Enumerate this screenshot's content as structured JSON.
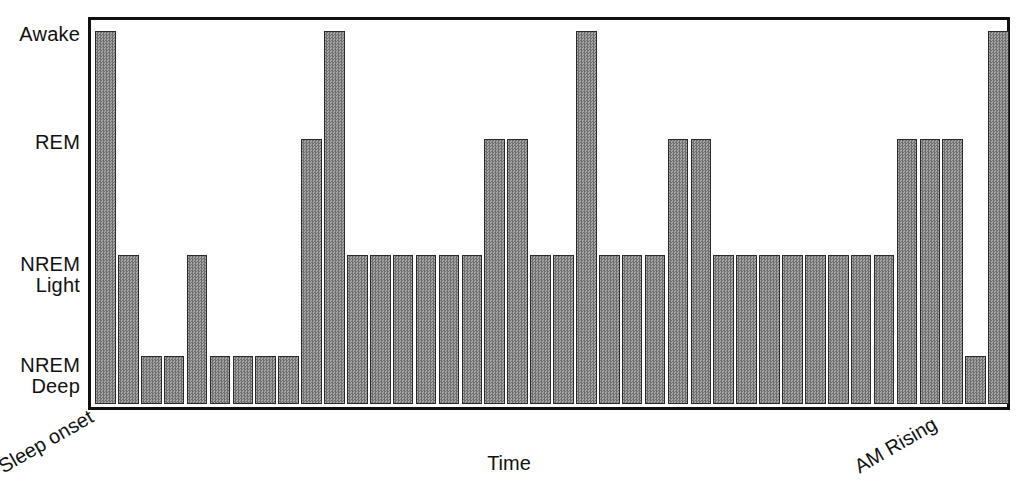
{
  "chart_data": {
    "type": "bar",
    "title": "",
    "subtitle": "",
    "xlabel": "Time",
    "ylabel": "",
    "grid": false,
    "legend": null,
    "y_categories": [
      "NREM Deep",
      "NREM Light",
      "REM",
      "Awake"
    ],
    "ytick_labels": [
      {
        "id": "awake",
        "line1": "Awake",
        "line2": "",
        "value": 4
      },
      {
        "id": "rem",
        "line1": "REM",
        "line2": "",
        "value": 3
      },
      {
        "id": "nrem-light",
        "line1": "NREM",
        "line2": "Light",
        "value": 2
      },
      {
        "id": "nrem-deep",
        "line1": "NREM",
        "line2": "Deep",
        "value": 1
      }
    ],
    "x_endpoint_labels": {
      "start": "Sleep onset",
      "end": "AM Rising"
    },
    "ylim": [
      0,
      4
    ],
    "categories": [
      "1",
      "2",
      "3",
      "4",
      "5",
      "6",
      "7",
      "8",
      "9",
      "10",
      "11",
      "12",
      "13",
      "14",
      "15",
      "16",
      "17",
      "18",
      "19",
      "20",
      "21",
      "22",
      "23",
      "24",
      "25",
      "26",
      "27",
      "28",
      "29",
      "30",
      "31"
    ],
    "values": [
      4,
      2,
      1,
      1,
      2,
      1,
      1,
      1,
      1,
      3,
      4,
      2,
      2,
      2,
      2,
      2,
      2,
      3,
      3,
      2,
      2,
      4,
      2,
      2,
      2,
      3,
      3,
      2,
      2,
      2,
      2
    ],
    "stages": [
      "Awake",
      "NREM Light",
      "NREM Deep",
      "NREM Deep",
      "NREM Light",
      "NREM Deep",
      "NREM Deep",
      "NREM Deep",
      "NREM Deep",
      "REM",
      "Awake",
      "NREM Light",
      "NREM Light",
      "NREM Light",
      "NREM Light",
      "NREM Light",
      "NREM Light",
      "REM",
      "REM",
      "NREM Light",
      "NREM Light",
      "Awake",
      "NREM Light",
      "NREM Light",
      "NREM Light",
      "REM",
      "REM",
      "NREM Light",
      "NREM Light",
      "NREM Light",
      "NREM Light"
    ],
    "extra_bars": {
      "note": "tail segment",
      "values": [
        2,
        2,
        2,
        2,
        3,
        3,
        3,
        1,
        4
      ],
      "stages": [
        "NREM Light",
        "NREM Light",
        "NREM Light",
        "NREM Light",
        "REM",
        "REM",
        "REM",
        "NREM Deep",
        "Awake"
      ]
    },
    "colors": {
      "bar_fill": "#8a8a8a",
      "bar_border": "#2a2a2a",
      "axis": "#111111",
      "background": "#ffffff",
      "caption": "#e2e2e2"
    }
  },
  "caption": {
    "text": ""
  }
}
